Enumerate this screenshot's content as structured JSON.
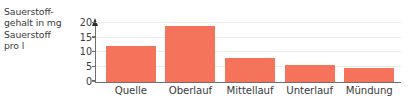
{
  "chart_data": {
    "type": "bar",
    "title": "",
    "ylabel_lines": [
      "Sauerstoff-",
      "gehalt in mg",
      "Sauerstoff",
      "pro l"
    ],
    "ylabel": "Sauerstoffgehalt in mg Sauerstoff pro l",
    "xlabel": "",
    "categories": [
      "Quelle",
      "Oberlauf",
      "Mittellauf",
      "Unterlauf",
      "Mündung"
    ],
    "values": [
      12,
      19,
      8,
      5.5,
      4.5
    ],
    "ylim": [
      0,
      21
    ],
    "yticks": [
      0,
      5,
      10,
      15,
      20
    ],
    "ytick_labels": [
      "0",
      "5",
      "10",
      "15",
      "20"
    ],
    "grid": true,
    "grid_axis": "y",
    "legend": false,
    "bar_color": "#f4735a",
    "text_color": "#3b3b3b",
    "axis_color": "#6f6f6f",
    "grid_color": "#ececec",
    "background": "#ffffff"
  }
}
